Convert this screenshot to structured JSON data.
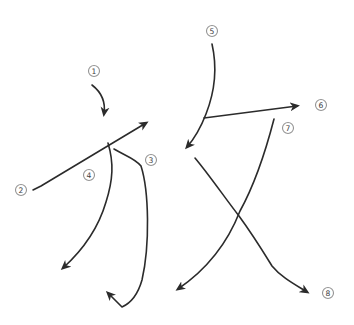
{
  "diagram": {
    "type": "stroke-order-diagram",
    "background_color": "#ffffff",
    "line_color": "#2b2b2b",
    "badge_outline_color": "#949494",
    "badge_number_color": "#3c3c3c",
    "strokes": [
      {
        "label": "1",
        "direction": "short curve downward"
      },
      {
        "label": "2",
        "direction": "long straight line up-right"
      },
      {
        "label": "3",
        "direction": "right then curve down with hook up-left"
      },
      {
        "label": "4",
        "direction": "sweeping curve down-left"
      },
      {
        "label": "5",
        "direction": "curve down-left"
      },
      {
        "label": "6",
        "direction": "straight line right"
      },
      {
        "label": "7",
        "direction": "long curve down-left"
      },
      {
        "label": "8",
        "direction": "diagonal down-right with bend"
      }
    ]
  }
}
